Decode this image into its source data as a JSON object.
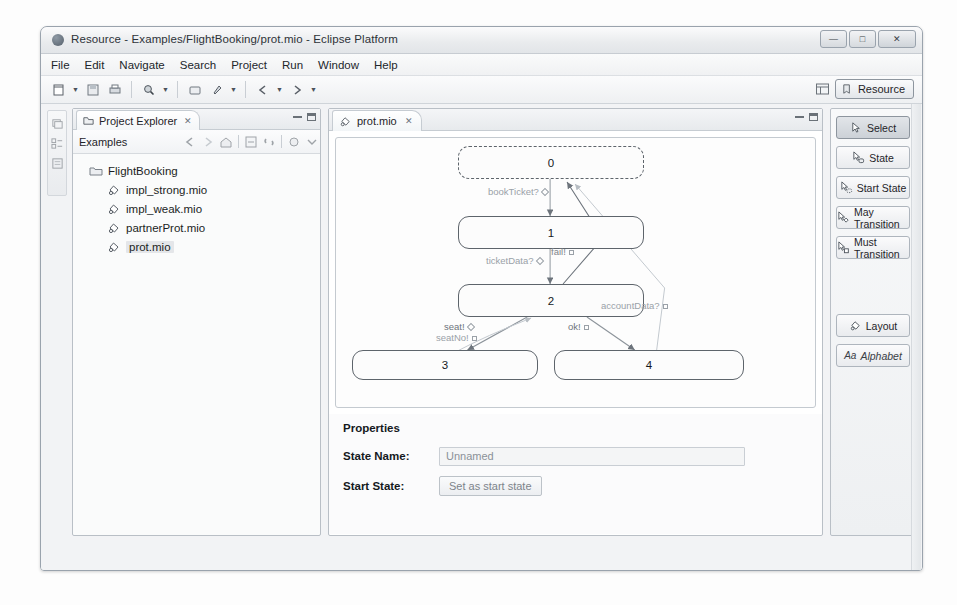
{
  "window": {
    "title": "Resource - Examples/FlightBooking/prot.mio - Eclipse Platform",
    "minimize_label": "—",
    "maximize_label": "□",
    "close_label": "✕"
  },
  "menubar": {
    "items": [
      {
        "label": "File",
        "mnemonic": "F"
      },
      {
        "label": "Edit",
        "mnemonic": "E"
      },
      {
        "label": "Navigate",
        "mnemonic": "N"
      },
      {
        "label": "Search",
        "mnemonic": "a"
      },
      {
        "label": "Project",
        "mnemonic": "P"
      },
      {
        "label": "Run",
        "mnemonic": "R"
      },
      {
        "label": "Window",
        "mnemonic": "W"
      },
      {
        "label": "Help",
        "mnemonic": "H"
      }
    ]
  },
  "toolbar": {
    "icons": [
      "new-wizard-icon",
      "save-icon",
      "print-icon",
      "search-icon",
      "open-type-icon",
      "run-icon",
      "back-icon",
      "forward-icon"
    ],
    "perspective": {
      "grid_icon": "open-perspective-icon",
      "current_label": "Resource",
      "current_icon": "resource-perspective-icon"
    }
  },
  "rail": {
    "icons": [
      "restore-view-icon",
      "outline-view-icon",
      "properties-view-icon"
    ]
  },
  "explorer": {
    "tab_label": "Project Explorer",
    "tab_icon": "project-explorer-icon",
    "tab_close": "✕",
    "toolbar_label": "Examples",
    "toolbar_icons": [
      "back-icon",
      "forward-icon",
      "home-icon",
      "collapse-all-icon",
      "link-editor-icon",
      "view-menu-icon",
      "view-chevron-icon"
    ],
    "tree": [
      {
        "label": "FlightBooking",
        "icon": "folder-icon",
        "level": 0,
        "selected": false
      },
      {
        "label": "impl_strong.mio",
        "icon": "mio-file-icon",
        "level": 1,
        "selected": false
      },
      {
        "label": "impl_weak.mio",
        "icon": "mio-file-icon",
        "level": 1,
        "selected": false
      },
      {
        "label": "partnerProt.mio",
        "icon": "mio-file-icon",
        "level": 1,
        "selected": false
      },
      {
        "label": "prot.mio",
        "icon": "mio-file-icon",
        "level": 1,
        "selected": true
      }
    ]
  },
  "editor": {
    "tab_label": "prot.mio",
    "tab_icon": "mio-file-icon",
    "tab_close": "✕",
    "diagram": {
      "states": [
        {
          "id": "0",
          "label": "0",
          "x": 122,
          "y": 8,
          "w": 186,
          "h": 33,
          "start": true
        },
        {
          "id": "1",
          "label": "1",
          "x": 122,
          "y": 78,
          "w": 186,
          "h": 33,
          "start": false
        },
        {
          "id": "2",
          "label": "2",
          "x": 122,
          "y": 146,
          "w": 186,
          "h": 33,
          "start": false
        },
        {
          "id": "3",
          "label": "3",
          "x": 16,
          "y": 212,
          "w": 186,
          "h": 30,
          "start": false
        },
        {
          "id": "4",
          "label": "4",
          "x": 218,
          "y": 212,
          "w": 190,
          "h": 30,
          "start": false
        }
      ],
      "transitions": [
        {
          "label": "bookTicket?",
          "marker": "diamond",
          "x": 152,
          "y": 48
        },
        {
          "label": "ticketData?",
          "marker": "diamond",
          "x": 150,
          "y": 117
        },
        {
          "label": "fail!",
          "marker": "square",
          "x": 215,
          "y": 110
        },
        {
          "label": "accountData?",
          "marker": "square",
          "x": 270,
          "y": 163
        },
        {
          "label": "seat!",
          "marker": "diamond",
          "x": 110,
          "y": 186
        },
        {
          "label": "seatNo!",
          "marker": "square",
          "x": 100,
          "y": 196
        },
        {
          "label": "ok!",
          "marker": "square",
          "x": 232,
          "y": 186
        }
      ]
    },
    "properties": {
      "title": "Properties",
      "state_name_label": "State Name:",
      "state_name_value": "Unnamed",
      "start_state_label": "Start State:",
      "start_state_button": "Set as start state"
    }
  },
  "palette": {
    "buttons": [
      {
        "label": "Select",
        "icon": "cursor-select-icon",
        "active": true
      },
      {
        "label": "State",
        "icon": "cursor-state-icon",
        "active": false
      },
      {
        "label": "Start State",
        "icon": "cursor-start-state-icon",
        "active": false
      },
      {
        "label": "May Transition",
        "icon": "cursor-may-transition-icon",
        "active": false
      },
      {
        "label": "Must Transition",
        "icon": "cursor-must-transition-icon",
        "active": false
      }
    ],
    "bottom_buttons": [
      {
        "label": "Layout",
        "icon": "layout-icon",
        "italic": false
      },
      {
        "label": "Alphabet",
        "icon": "alphabet-icon",
        "italic": true
      }
    ]
  },
  "statusbar": {
    "left_icon": "status-selection-icon",
    "right_icons": [
      "status-a-icon",
      "status-edit-icon",
      "status-lock-icon",
      "status-mio-icon"
    ]
  }
}
